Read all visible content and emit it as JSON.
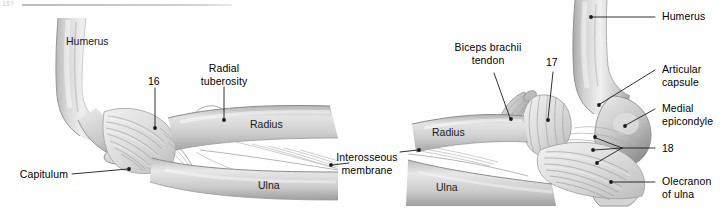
{
  "figure": {
    "top_page_number": "16?",
    "rule_present": true,
    "background_color": "#ffffff",
    "label_color": "#000000",
    "leader_line_color": "#1a1a1a",
    "bone_light": "#e9e9e9",
    "bone_mid": "#c9c9c9",
    "bone_dark": "#9a9a9a"
  },
  "left_panel": {
    "name": "elbow-lateral-view",
    "labels": [
      {
        "id": "humerus",
        "text": "Humerus",
        "kind": "on-bone"
      },
      {
        "id": "number-16",
        "text": "16",
        "kind": "number"
      },
      {
        "id": "radial-tuberosity",
        "text": "Radial\ntuberosity",
        "kind": "leader"
      },
      {
        "id": "radius",
        "text": "Radius",
        "kind": "on-bone"
      },
      {
        "id": "ulna",
        "text": "Ulna",
        "kind": "on-bone"
      },
      {
        "id": "capitulum",
        "text": "Capitulum",
        "kind": "leader"
      }
    ]
  },
  "shared_labels": [
    {
      "id": "interosseous-membrane",
      "text": "Interosseous\nmembrane",
      "kind": "leader-both"
    }
  ],
  "right_panel": {
    "name": "elbow-medial-view",
    "labels": [
      {
        "id": "biceps-brachii-tendon",
        "text": "Biceps brachii\ntendon",
        "kind": "leader"
      },
      {
        "id": "number-17",
        "text": "17",
        "kind": "number"
      },
      {
        "id": "humerus",
        "text": "Humerus",
        "kind": "leader"
      },
      {
        "id": "articular-capsule",
        "text": "Articular\ncapsule",
        "kind": "leader"
      },
      {
        "id": "medial-epicondyle",
        "text": "Medial\nepicondyle",
        "kind": "leader"
      },
      {
        "id": "number-18",
        "text": "18",
        "kind": "number"
      },
      {
        "id": "olecranon-of-ulna",
        "text": "Olecranon\nof ulna",
        "kind": "leader"
      },
      {
        "id": "radius",
        "text": "Radius",
        "kind": "on-bone"
      },
      {
        "id": "ulna",
        "text": "Ulna",
        "kind": "on-bone"
      }
    ]
  },
  "text": {
    "humerus_left": "Humerus",
    "n16": "16",
    "radial_tuberosity_l1": "Radial",
    "radial_tuberosity_l2": "tuberosity",
    "radius_left": "Radius",
    "ulna_left": "Ulna",
    "capitulum": "Capitulum",
    "interosseous_l1": "Interosseous",
    "interosseous_l2": "membrane",
    "biceps_l1": "Biceps brachii",
    "biceps_l2": "tendon",
    "n17": "17",
    "humerus_right": "Humerus",
    "articular_l1": "Articular",
    "articular_l2": "capsule",
    "medial_l1": "Medial",
    "medial_l2": "epicondyle",
    "n18": "18",
    "olecranon_l1": "Olecranon",
    "olecranon_l2": "of ulna",
    "radius_right": "Radius",
    "ulna_right": "Ulna",
    "top_corner": "16?"
  }
}
